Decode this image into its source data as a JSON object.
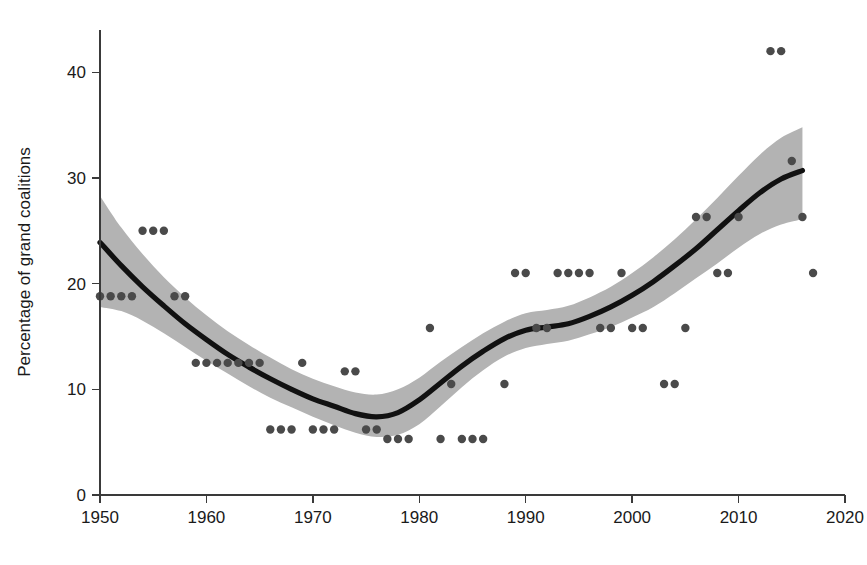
{
  "chart_data": {
    "type": "scatter",
    "title": "",
    "xlabel": "",
    "ylabel": "Percentage of grand coalitions",
    "xlim": [
      1950,
      2020
    ],
    "ylim": [
      0,
      44
    ],
    "xticks": [
      1950,
      1960,
      1970,
      1980,
      1990,
      2000,
      2010,
      2020
    ],
    "xtick_labels": [
      "1950",
      "1960",
      "1970",
      "1980",
      "1990",
      "2000",
      "2010",
      "2020"
    ],
    "yticks": [
      0,
      10,
      20,
      30,
      40
    ],
    "ytick_labels": [
      "0",
      "10",
      "20",
      "30",
      "40"
    ],
    "grid": false,
    "legend": "none",
    "series": [
      {
        "name": "Observations",
        "type": "scatter",
        "marker": "circle",
        "color": "#4a4a4a",
        "points": [
          [
            1950,
            18.8
          ],
          [
            1951,
            18.8
          ],
          [
            1952,
            18.8
          ],
          [
            1953,
            18.8
          ],
          [
            1954,
            25.0
          ],
          [
            1955,
            25.0
          ],
          [
            1956,
            25.0
          ],
          [
            1957,
            18.8
          ],
          [
            1958,
            18.8
          ],
          [
            1959,
            12.5
          ],
          [
            1960,
            12.5
          ],
          [
            1961,
            12.5
          ],
          [
            1962,
            12.5
          ],
          [
            1963,
            12.5
          ],
          [
            1964,
            12.5
          ],
          [
            1965,
            12.5
          ],
          [
            1966,
            6.2
          ],
          [
            1967,
            6.2
          ],
          [
            1968,
            6.2
          ],
          [
            1969,
            12.5
          ],
          [
            1970,
            6.2
          ],
          [
            1971,
            6.2
          ],
          [
            1972,
            6.2
          ],
          [
            1973,
            11.7
          ],
          [
            1974,
            11.7
          ],
          [
            1975,
            6.2
          ],
          [
            1976,
            6.2
          ],
          [
            1977,
            5.3
          ],
          [
            1978,
            5.3
          ],
          [
            1979,
            5.3
          ],
          [
            1981,
            15.8
          ],
          [
            1982,
            5.3
          ],
          [
            1983,
            10.5
          ],
          [
            1984,
            5.3
          ],
          [
            1985,
            5.3
          ],
          [
            1986,
            5.3
          ],
          [
            1988,
            10.5
          ],
          [
            1989,
            21.0
          ],
          [
            1990,
            21.0
          ],
          [
            1991,
            15.8
          ],
          [
            1992,
            15.8
          ],
          [
            1993,
            21.0
          ],
          [
            1994,
            21.0
          ],
          [
            1995,
            21.0
          ],
          [
            1996,
            21.0
          ],
          [
            1997,
            15.8
          ],
          [
            1998,
            15.8
          ],
          [
            1999,
            21.0
          ],
          [
            2000,
            15.8
          ],
          [
            2001,
            15.8
          ],
          [
            2003,
            10.5
          ],
          [
            2004,
            10.5
          ],
          [
            2005,
            15.8
          ],
          [
            2006,
            26.3
          ],
          [
            2007,
            26.3
          ],
          [
            2008,
            21.0
          ],
          [
            2009,
            21.0
          ],
          [
            2010,
            26.3
          ],
          [
            2013,
            42.0
          ],
          [
            2014,
            42.0
          ],
          [
            2015,
            31.6
          ],
          [
            2016,
            26.3
          ],
          [
            2017,
            21.0
          ]
        ]
      },
      {
        "name": "Smoothed trend",
        "type": "line",
        "color": "#111111",
        "points": [
          [
            1950,
            23.9
          ],
          [
            1952,
            21.7
          ],
          [
            1954,
            19.7
          ],
          [
            1956,
            17.9
          ],
          [
            1958,
            16.2
          ],
          [
            1960,
            14.7
          ],
          [
            1962,
            13.3
          ],
          [
            1964,
            12.1
          ],
          [
            1966,
            11.0
          ],
          [
            1968,
            10.0
          ],
          [
            1970,
            9.1
          ],
          [
            1972,
            8.4
          ],
          [
            1974,
            7.7
          ],
          [
            1976,
            7.4
          ],
          [
            1978,
            7.8
          ],
          [
            1980,
            9.0
          ],
          [
            1982,
            10.6
          ],
          [
            1984,
            12.2
          ],
          [
            1986,
            13.6
          ],
          [
            1988,
            14.8
          ],
          [
            1990,
            15.6
          ],
          [
            1992,
            15.9
          ],
          [
            1994,
            16.2
          ],
          [
            1996,
            16.9
          ],
          [
            1998,
            17.8
          ],
          [
            2000,
            18.9
          ],
          [
            2002,
            20.2
          ],
          [
            2004,
            21.7
          ],
          [
            2006,
            23.3
          ],
          [
            2008,
            25.1
          ],
          [
            2010,
            26.9
          ],
          [
            2012,
            28.6
          ],
          [
            2014,
            29.9
          ],
          [
            2016,
            30.7
          ]
        ]
      }
    ],
    "confidence_band": {
      "name": "95% confidence interval",
      "color": "#b3b3b3",
      "upper": [
        [
          1950,
          28.3
        ],
        [
          1952,
          25.3
        ],
        [
          1954,
          22.8
        ],
        [
          1956,
          20.6
        ],
        [
          1958,
          18.7
        ],
        [
          1960,
          17.0
        ],
        [
          1962,
          15.5
        ],
        [
          1964,
          14.2
        ],
        [
          1966,
          13.0
        ],
        [
          1968,
          11.9
        ],
        [
          1970,
          11.0
        ],
        [
          1972,
          10.3
        ],
        [
          1974,
          9.7
        ],
        [
          1976,
          9.5
        ],
        [
          1978,
          10.0
        ],
        [
          1980,
          11.1
        ],
        [
          1982,
          12.6
        ],
        [
          1984,
          14.0
        ],
        [
          1986,
          15.3
        ],
        [
          1988,
          16.4
        ],
        [
          1990,
          17.2
        ],
        [
          1992,
          17.5
        ],
        [
          1994,
          17.9
        ],
        [
          1996,
          18.7
        ],
        [
          1998,
          19.7
        ],
        [
          2000,
          21.0
        ],
        [
          2002,
          22.5
        ],
        [
          2004,
          24.2
        ],
        [
          2006,
          26.1
        ],
        [
          2008,
          28.1
        ],
        [
          2010,
          30.2
        ],
        [
          2012,
          32.2
        ],
        [
          2014,
          33.8
        ],
        [
          2016,
          34.8
        ]
      ],
      "lower": [
        [
          1950,
          17.8
        ],
        [
          1952,
          17.4
        ],
        [
          1954,
          16.5
        ],
        [
          1956,
          15.3
        ],
        [
          1958,
          14.0
        ],
        [
          1960,
          12.7
        ],
        [
          1962,
          11.5
        ],
        [
          1964,
          10.3
        ],
        [
          1966,
          9.2
        ],
        [
          1968,
          8.3
        ],
        [
          1970,
          7.4
        ],
        [
          1972,
          6.6
        ],
        [
          1974,
          5.9
        ],
        [
          1976,
          5.5
        ],
        [
          1978,
          5.7
        ],
        [
          1980,
          6.7
        ],
        [
          1982,
          8.4
        ],
        [
          1984,
          10.2
        ],
        [
          1986,
          11.8
        ],
        [
          1988,
          13.1
        ],
        [
          1990,
          13.9
        ],
        [
          1992,
          14.3
        ],
        [
          1994,
          14.6
        ],
        [
          1996,
          15.2
        ],
        [
          1998,
          15.9
        ],
        [
          2000,
          16.8
        ],
        [
          2002,
          17.8
        ],
        [
          2004,
          19.1
        ],
        [
          2006,
          20.5
        ],
        [
          2008,
          21.9
        ],
        [
          2010,
          23.4
        ],
        [
          2012,
          24.7
        ],
        [
          2014,
          25.6
        ],
        [
          2016,
          26.1
        ]
      ]
    }
  },
  "geometry": {
    "plot_left": 100,
    "plot_right": 845,
    "plot_top": 30,
    "plot_bottom": 495,
    "y_axis_x": 100,
    "y_axis_top": 30,
    "y_axis_bottom": 495,
    "tick_len": 8
  }
}
